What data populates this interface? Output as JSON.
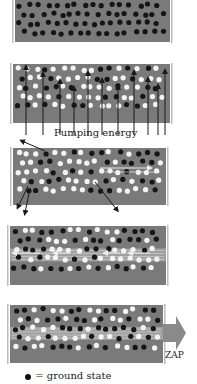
{
  "colors": {
    "medium": "#7a7a7a",
    "ground_dot": "#151515",
    "excited_dot": "#f4f4f4",
    "mirror": "#bdbdbd",
    "arrow": "#1a1a1a",
    "beam": "#cfcfcf",
    "zap_arrow": "#8a8a8a"
  },
  "panels": [
    {
      "name": "panel-ground-state",
      "x": 15,
      "y": 0,
      "w": 155,
      "h": 42,
      "excited_ratio": 0.0,
      "seed": 3,
      "beam": false
    },
    {
      "name": "panel-pumping",
      "x": 13,
      "y": 64,
      "w": 157,
      "h": 59,
      "excited_ratio": 0.62,
      "seed": 7,
      "beam": false
    },
    {
      "name": "panel-spontaneous-emission",
      "x": 13,
      "y": 148,
      "w": 153,
      "h": 57,
      "excited_ratio": 0.6,
      "seed": 11,
      "beam": false
    },
    {
      "name": "panel-stimulated-emission",
      "x": 10,
      "y": 226,
      "w": 156,
      "h": 59,
      "excited_ratio": 0.5,
      "seed": 19,
      "beam": true
    },
    {
      "name": "panel-laser-output",
      "x": 10,
      "y": 305,
      "w": 153,
      "h": 58,
      "excited_ratio": 0.4,
      "seed": 23,
      "beam": true
    }
  ],
  "pump_arrows_x": [
    26,
    43,
    60,
    74,
    88,
    102,
    118,
    134,
    148,
    158,
    165
  ],
  "labels": {
    "pumping": "Pumping energy",
    "zap": "ZAP"
  },
  "legend": {
    "ground_state": "= ground state"
  }
}
